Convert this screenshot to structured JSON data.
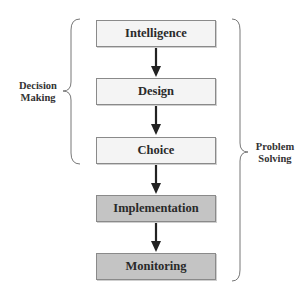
{
  "diagram": {
    "type": "flowchart",
    "steps": [
      {
        "label": "Intelligence",
        "group": "decision-making",
        "shade": "light"
      },
      {
        "label": "Design",
        "group": "decision-making",
        "shade": "light"
      },
      {
        "label": "Choice",
        "group": "decision-making",
        "shade": "light"
      },
      {
        "label": "Implementation",
        "group": "problem-solving",
        "shade": "dark"
      },
      {
        "label": "Monitoring",
        "group": "problem-solving",
        "shade": "dark"
      }
    ],
    "left_brace": {
      "line1": "Decision",
      "line2": "Making"
    },
    "right_brace": {
      "line1": "Problem",
      "line2": "Solving"
    },
    "colors": {
      "light_box": "#f4f4f4",
      "dark_box": "#c4c4c4",
      "border": "#8a8a8a",
      "arrow": "#222222"
    }
  }
}
